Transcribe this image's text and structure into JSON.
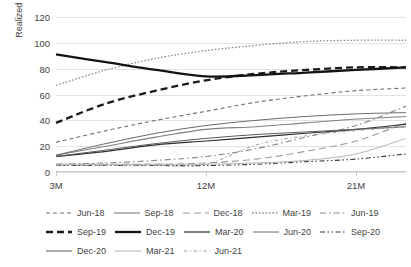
{
  "chart_data": {
    "type": "line",
    "title": "",
    "xlabel": "",
    "ylabel": "Realized volatility in bp",
    "ylim": [
      0,
      120
    ],
    "yticks": [
      0,
      20,
      40,
      60,
      80,
      100,
      120
    ],
    "x": [
      "3M",
      "6M",
      "9M",
      "12M",
      "15M",
      "18M",
      "21M",
      "24M"
    ],
    "xticks": [
      "3M",
      "12M",
      "21M"
    ],
    "grid": true,
    "legend_position": "bottom",
    "series": [
      {
        "name": "Jun-18",
        "values": [
          23,
          32,
          40,
          47,
          54,
          59,
          63,
          65
        ],
        "style": "dashed",
        "color": "#6f6f6f",
        "width": 1.1
      },
      {
        "name": "Sep-18",
        "values": [
          13,
          20,
          27,
          33,
          35,
          38,
          41,
          43
        ],
        "style": "solid",
        "color": "#808080",
        "width": 1.1
      },
      {
        "name": "Dec-18",
        "values": [
          6,
          6,
          6,
          7,
          10,
          16,
          24,
          38
        ],
        "style": "longdash",
        "color": "#9a9a9a",
        "width": 1.1
      },
      {
        "name": "Mar-19",
        "values": [
          67,
          79,
          88,
          94,
          98,
          101,
          102,
          102
        ],
        "style": "dotted",
        "color": "#8d8d8d",
        "width": 1.3
      },
      {
        "name": "Jun-19",
        "values": [
          6,
          7,
          9,
          12,
          18,
          27,
          36,
          51
        ],
        "style": "dashdot",
        "color": "#8a8a8a",
        "width": 1.1
      },
      {
        "name": "Sep-19",
        "values": [
          38,
          53,
          63,
          71,
          76,
          79,
          81,
          81
        ],
        "style": "thickdash",
        "color": "#1c1c1c",
        "width": 2.3
      },
      {
        "name": "Dec-19",
        "values": [
          91,
          85,
          79,
          74,
          75,
          77,
          79,
          81
        ],
        "style": "thicksolid",
        "color": "#141414",
        "width": 2.3
      },
      {
        "name": "Mar-20",
        "values": [
          12,
          16,
          21,
          24,
          27,
          30,
          33,
          37
        ],
        "style": "solid",
        "color": "#2d2d2d",
        "width": 1.2
      },
      {
        "name": "Jun-20",
        "values": [
          13,
          22,
          30,
          36,
          40,
          43,
          45,
          46
        ],
        "style": "solid",
        "color": "#6a6a6a",
        "width": 1.0
      },
      {
        "name": "Sep-20",
        "values": [
          5,
          5,
          5,
          5,
          6,
          8,
          10,
          14
        ],
        "style": "dashdotdot",
        "color": "#3a3a3a",
        "width": 1.1
      },
      {
        "name": "Dec-20",
        "values": [
          12,
          17,
          22,
          26,
          29,
          31,
          33,
          35
        ],
        "style": "solid",
        "color": "#5a5a5a",
        "width": 1.0
      },
      {
        "name": "Mar-21",
        "values": [
          6,
          6,
          6,
          6,
          7,
          9,
          14,
          26
        ],
        "style": "solid",
        "color": "#b4b4b4",
        "width": 1.0
      },
      {
        "name": "Jun-21",
        "values": [
          5,
          5,
          5,
          6,
          21,
          28,
          32,
          35
        ],
        "style": "shortdashdot",
        "color": "#9d9d9d",
        "width": 1.0
      }
    ]
  },
  "axis": {
    "ylabel": "Realized volatility in bp",
    "yticks": [
      "120",
      "100",
      "80",
      "60",
      "40",
      "20",
      "0"
    ],
    "xticks": [
      "3M",
      "12M",
      "21M"
    ]
  },
  "legend": {
    "rows": [
      [
        {
          "label": "Jun-18",
          "style": "dashed"
        },
        {
          "label": "Sep-18",
          "style": "solid"
        },
        {
          "label": "Dec-18",
          "style": "longdash"
        },
        {
          "label": "Mar-19",
          "style": "dotted"
        },
        {
          "label": "Jun-19",
          "style": "dashdot"
        }
      ],
      [
        {
          "label": "Sep-19",
          "style": "thickdash"
        },
        {
          "label": "Dec-19",
          "style": "thicksolid"
        },
        {
          "label": "Mar-20",
          "style": "solid"
        },
        {
          "label": "Jun-20",
          "style": "solid"
        },
        {
          "label": "Sep-20",
          "style": "dashdotdot"
        }
      ],
      [
        {
          "label": "Dec-20",
          "style": "solid"
        },
        {
          "label": "Mar-21",
          "style": "solid"
        },
        {
          "label": "Jun-21",
          "style": "shortdashdot"
        }
      ]
    ]
  }
}
